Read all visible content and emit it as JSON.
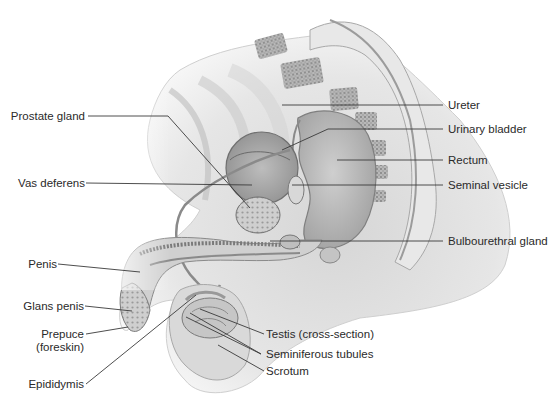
{
  "diagram": {
    "labels_left": [
      {
        "id": "prostate-gland",
        "text": "Prostate gland"
      },
      {
        "id": "vas-deferens",
        "text": "Vas deferens"
      },
      {
        "id": "penis",
        "text": "Penis"
      },
      {
        "id": "glans-penis",
        "text": "Glans penis"
      },
      {
        "id": "prepuce",
        "text": "Prepuce",
        "text2": "(foreskin)"
      },
      {
        "id": "epididymis",
        "text": "Epididymis"
      }
    ],
    "labels_right": [
      {
        "id": "ureter",
        "text": "Ureter"
      },
      {
        "id": "urinary-bladder",
        "text": "Urinary bladder"
      },
      {
        "id": "rectum",
        "text": "Rectum"
      },
      {
        "id": "seminal-vesicle",
        "text": "Seminal vesicle"
      },
      {
        "id": "bulbourethral-gland",
        "text": "Bulbourethral gland"
      }
    ],
    "labels_bottom": [
      {
        "id": "testis",
        "text": "Testis (cross-section)"
      },
      {
        "id": "seminiferous-tubules",
        "text": "Seminiferous tubules"
      },
      {
        "id": "scrotum",
        "text": "Scrotum"
      }
    ],
    "colors": {
      "background": "#ffffff",
      "label_text": "#2a2a2a",
      "leader_line": "#3a3a3a",
      "tissue_light": "#e4e4e4",
      "tissue_mid": "#c8c8c8",
      "tissue_dark": "#9a9a9a"
    }
  }
}
